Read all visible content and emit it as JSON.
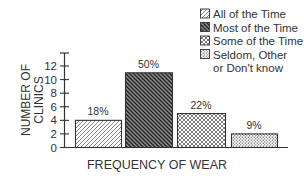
{
  "chart_data": {
    "type": "bar",
    "title": "",
    "xlabel": "FREQUENCY OF WEAR",
    "ylabel": "NUMBER OF CLINICS",
    "ylabel_lines": [
      "NUMBER OF",
      "CLINICS"
    ],
    "ylim": [
      0,
      12
    ],
    "yticks": [
      0,
      2,
      4,
      6,
      8,
      10,
      12
    ],
    "grid": false,
    "legend_position": "top-right",
    "categories": [
      "All of the Time",
      "Most of the Time",
      "Some of the Time",
      "Seldom, Other or Don't know"
    ],
    "legend": [
      {
        "label_lines": [
          "All of the Time"
        ],
        "pattern": "light-diagonal-hatch"
      },
      {
        "label_lines": [
          "Most of the Time"
        ],
        "pattern": "dark-dense-diagonal-hatch"
      },
      {
        "label_lines": [
          "Some of the Time"
        ],
        "pattern": "crosshatch"
      },
      {
        "label_lines": [
          "Seldom, Other",
          "or Don't know"
        ],
        "pattern": "stipple"
      }
    ],
    "values": [
      4,
      11,
      5,
      2
    ],
    "data_labels": [
      "18%",
      "50%",
      "22%",
      "9%"
    ]
  }
}
